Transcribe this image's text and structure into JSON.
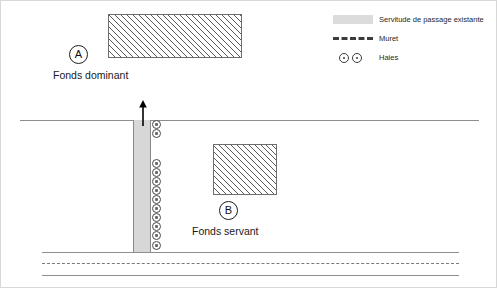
{
  "diagram": {
    "parcels": [
      {
        "id": "A",
        "marker": "A",
        "label": "Fonds dominant",
        "fill": "hatched"
      },
      {
        "id": "B",
        "marker": "B",
        "label": "Fonds servant",
        "fill": "hatched"
      }
    ],
    "easement": {
      "name": "servitude-strip",
      "color": "#d7d7d7",
      "direction": "up"
    },
    "road": {
      "name": "road",
      "center_line_style": "dashed"
    },
    "hedges": {
      "name": "haies",
      "count_upper": 2,
      "count_lower": 10
    }
  },
  "legend": {
    "items": [
      {
        "icon": "gray-band-swatch",
        "label": "Servitude de passage existante"
      },
      {
        "icon": "dashed-line-swatch",
        "label": "Muret"
      },
      {
        "icon": "double-circle-swatch",
        "label": "Haies"
      }
    ]
  },
  "colors": {
    "easement": "#d7d7d7",
    "hatch": "#5a5a5a",
    "line": "#8e8e8e",
    "text": "#1a1a1a"
  }
}
